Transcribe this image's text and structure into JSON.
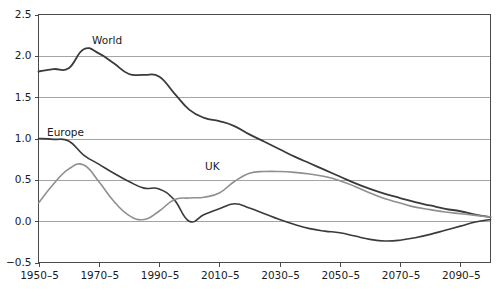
{
  "chart_data": {
    "type": "line",
    "title": "",
    "subtitle": "",
    "xlabel": "",
    "ylabel": "",
    "xlim": [
      1950,
      2100
    ],
    "ylim": [
      -0.5,
      2.5
    ],
    "grid": true,
    "legend_position": "inline-labels",
    "x_tick_labels": [
      "1950–5",
      "1970–5",
      "1990–5",
      "2010–5",
      "2030–5",
      "2050–5",
      "2070–5",
      "2090–5"
    ],
    "x_tick_values": [
      1950,
      1970,
      1990,
      2010,
      2030,
      2050,
      2070,
      2090
    ],
    "y_tick_labels": [
      "2.5",
      "2.0",
      "1.5",
      "1.0",
      "0.5",
      "0.0",
      "−0.5"
    ],
    "y_tick_values": [
      2.5,
      2.0,
      1.5,
      1.0,
      0.5,
      0.0,
      -0.5
    ],
    "x": [
      1950,
      1955,
      1960,
      1965,
      1970,
      1975,
      1980,
      1985,
      1990,
      1995,
      2000,
      2005,
      2010,
      2015,
      2020,
      2025,
      2030,
      2035,
      2040,
      2045,
      2050,
      2055,
      2060,
      2065,
      2070,
      2075,
      2080,
      2085,
      2090,
      2095,
      2100
    ],
    "series": [
      {
        "name": "World",
        "color": "#3a3a3a",
        "width": 1.8,
        "values": [
          1.81,
          1.84,
          1.85,
          2.08,
          2.03,
          1.91,
          1.78,
          1.77,
          1.75,
          1.55,
          1.35,
          1.25,
          1.21,
          1.15,
          1.05,
          0.96,
          0.87,
          0.78,
          0.7,
          0.62,
          0.54,
          0.46,
          0.39,
          0.33,
          0.28,
          0.23,
          0.19,
          0.15,
          0.12,
          0.08,
          0.05
        ]
      },
      {
        "name": "Europe",
        "color": "#3a3a3a",
        "width": 1.6,
        "values": [
          1.0,
          0.99,
          0.97,
          0.8,
          0.69,
          0.58,
          0.48,
          0.4,
          0.39,
          0.26,
          0.0,
          0.08,
          0.15,
          0.21,
          0.16,
          0.09,
          0.02,
          -0.04,
          -0.09,
          -0.12,
          -0.14,
          -0.18,
          -0.22,
          -0.24,
          -0.23,
          -0.2,
          -0.16,
          -0.11,
          -0.06,
          -0.01,
          0.02
        ]
      },
      {
        "name": "UK",
        "color": "#8f8f8f",
        "width": 1.6,
        "values": [
          0.22,
          0.45,
          0.63,
          0.68,
          0.48,
          0.24,
          0.07,
          0.02,
          0.12,
          0.26,
          0.28,
          0.29,
          0.34,
          0.48,
          0.58,
          0.6,
          0.6,
          0.59,
          0.57,
          0.54,
          0.49,
          0.42,
          0.34,
          0.27,
          0.22,
          0.17,
          0.14,
          0.11,
          0.09,
          0.07,
          0.05
        ]
      }
    ],
    "inline_labels": [
      {
        "text": "World",
        "x_px": 92,
        "y_px": 44
      },
      {
        "text": "Europe",
        "x_px": 47,
        "y_px": 136
      },
      {
        "text": "UK",
        "x_px": 205,
        "y_px": 170
      }
    ]
  }
}
